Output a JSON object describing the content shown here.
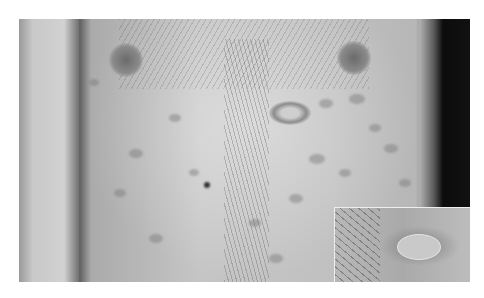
{
  "image": {
    "description": "Grayscale clinical photograph of a male torso showing multiple oval patches on the chest and abdomen, with a larger herald patch and a magnified inset of a single lesion in the bottom-right corner",
    "inset": {
      "position": "bottom-right",
      "content": "close-up of an oval lesion with a collarette of scale"
    }
  }
}
